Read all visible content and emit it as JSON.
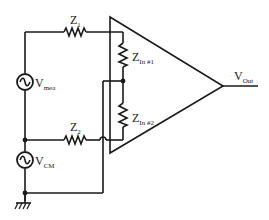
{
  "diagram": {
    "type": "circuit-schematic",
    "components": {
      "z1": {
        "label": "Z",
        "sub": "1"
      },
      "z2": {
        "label": "Z",
        "sub": "2"
      },
      "zin1": {
        "label": "Z",
        "sub": "In #1"
      },
      "zin2": {
        "label": "Z",
        "sub": "In #2"
      },
      "vmea": {
        "label": "V",
        "sub": "mea"
      },
      "vcm": {
        "label": "V",
        "sub": "CM"
      },
      "vout": {
        "label": "V",
        "sub": "Out"
      },
      "amplifier": {
        "label": ""
      },
      "ground": {
        "label": ""
      }
    },
    "colors": {
      "line": "#1a1a1a",
      "background": "#ffffff"
    }
  }
}
